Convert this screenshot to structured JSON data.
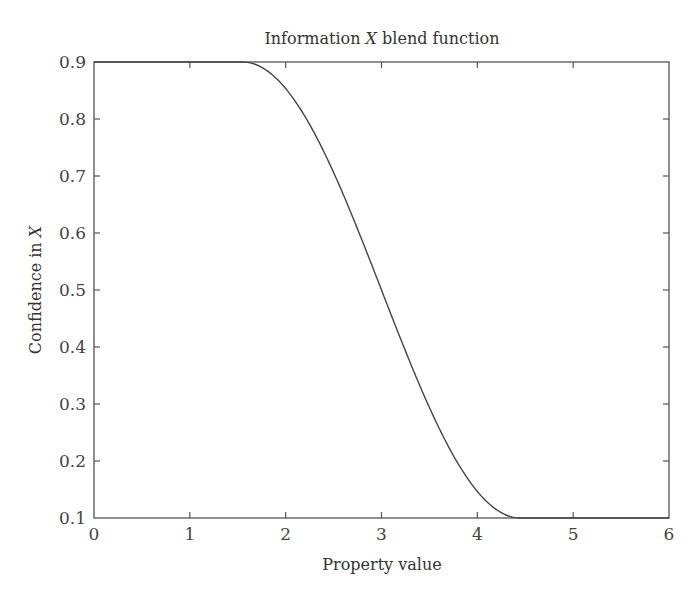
{
  "chart_data": {
    "type": "line",
    "title": "Information X blend function",
    "title_parts": [
      "Information ",
      "X",
      " blend function"
    ],
    "xlabel": "Property value",
    "ylabel": "Confidence in X",
    "ylabel_parts": [
      "Confidence in ",
      "X"
    ],
    "xlim": [
      0,
      6
    ],
    "ylim": [
      0.1,
      0.9
    ],
    "xticks": [
      "0",
      "1",
      "2",
      "3",
      "4",
      "5",
      "6"
    ],
    "yticks": [
      "0.1",
      "0.2",
      "0.3",
      "0.4",
      "0.5",
      "0.6",
      "0.7",
      "0.8",
      "0.9"
    ],
    "grid": false,
    "legend": null,
    "series": [
      {
        "name": "Confidence in X",
        "color": "#444444",
        "x": [
          0,
          0.5,
          1.0,
          1.55,
          1.75,
          2.0,
          2.25,
          2.5,
          2.75,
          3.0,
          3.25,
          3.5,
          3.75,
          4.0,
          4.25,
          4.45,
          5.0,
          5.5,
          6.0
        ],
        "y": [
          0.9,
          0.9,
          0.9,
          0.9,
          0.881,
          0.829,
          0.751,
          0.653,
          0.541,
          0.5,
          0.398,
          0.289,
          0.199,
          0.129,
          0.105,
          0.1,
          0.1,
          0.1,
          0.1
        ]
      }
    ]
  }
}
